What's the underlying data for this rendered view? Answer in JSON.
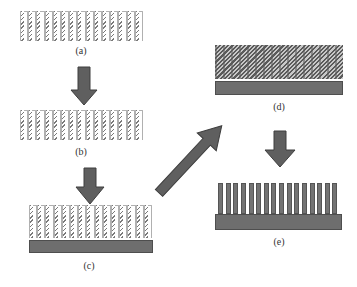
{
  "diagram": {
    "steps": [
      {
        "id": "a",
        "label": "(a)",
        "content": "free-standing striped comb array"
      },
      {
        "id": "b",
        "label": "(b)",
        "content": "comb array with connected top"
      },
      {
        "id": "c",
        "label": "(c)",
        "content": "comb array placed on substrate"
      },
      {
        "id": "d",
        "label": "(d)",
        "content": "densely filled array on substrate"
      },
      {
        "id": "e",
        "label": "(e)",
        "content": "solid pillar array on substrate"
      }
    ],
    "arrows": [
      {
        "from": "a",
        "to": "b",
        "direction": "down"
      },
      {
        "from": "b",
        "to": "c",
        "direction": "down"
      },
      {
        "from": "c",
        "to": "d",
        "direction": "diagonal-up-right"
      },
      {
        "from": "d",
        "to": "e",
        "direction": "down"
      }
    ],
    "colors": {
      "arrow_fill": "#5f5f5f",
      "arrow_stroke": "#3e3e3e",
      "substrate": "#6e6e6e",
      "pillar": "#737373",
      "stripe": "#7a7a7a"
    },
    "pillar_count_e": 16
  }
}
